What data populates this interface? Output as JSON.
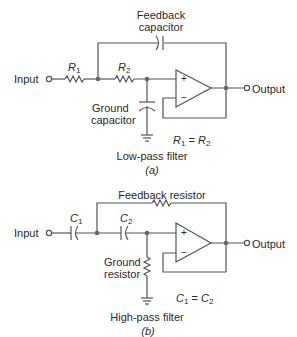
{
  "figure_a": {
    "feedback_label_line1": "Feedback",
    "feedback_label_line2": "capacitor",
    "input_label": "Input",
    "output_label": "Output",
    "r1_label": "R",
    "r1_sub": "1",
    "r2_label": "R",
    "r2_sub": "2",
    "ground_label_line1": "Ground",
    "ground_label_line2": "capacitor",
    "opamp_plus": "+",
    "opamp_minus": "−",
    "equation_left": "R",
    "equation_left_sub": "1",
    "equation_eq": " = ",
    "equation_right": "R",
    "equation_right_sub": "2",
    "title": "Low-pass filter",
    "caption": "(a)"
  },
  "figure_b": {
    "feedback_label": "Feedback resistor",
    "input_label": "Input",
    "output_label": "Output",
    "c1_label": "C",
    "c1_sub": "1",
    "c2_label": "C",
    "c2_sub": "2",
    "ground_label_line1": "Ground",
    "ground_label_line2": "resistor",
    "opamp_plus": "+",
    "opamp_minus": "−",
    "equation_left": "C",
    "equation_left_sub": "1",
    "equation_eq": " = ",
    "equation_right": "C",
    "equation_right_sub": "2",
    "title": "High-pass filter",
    "caption": "(b)"
  },
  "colors": {
    "wire": "#555555",
    "text": "#2a2a2a"
  }
}
